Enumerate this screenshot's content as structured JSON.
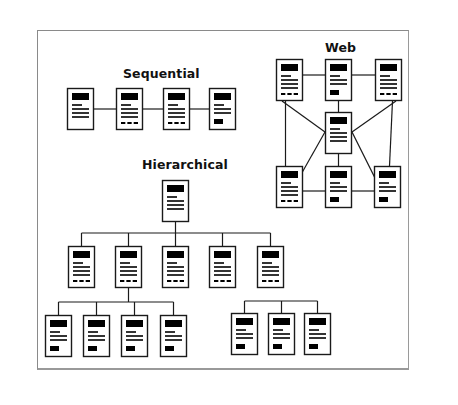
{
  "titles": {
    "sequential": "Sequential",
    "web": "Web",
    "hierarchical": "Hierarchical"
  },
  "colors": {
    "line": "#1a1a1a",
    "page_fill": "#ffffff",
    "block": "#000000",
    "frame": "#8a8a8a"
  },
  "page_icon": {
    "w": 27,
    "h": 42,
    "elements": [
      "header-block",
      "text-lines",
      "footer-dashes-or-button"
    ]
  },
  "diagrams": {
    "sequential": {
      "pages": [
        {
          "x": 67,
          "y": 88,
          "footer": "none"
        },
        {
          "x": 116,
          "y": 88,
          "footer": "dashes"
        },
        {
          "x": 163,
          "y": 88,
          "footer": "dashes"
        },
        {
          "x": 209,
          "y": 88,
          "footer": "button"
        }
      ],
      "links": [
        [
          0,
          1
        ],
        [
          1,
          2
        ],
        [
          2,
          3
        ]
      ]
    },
    "web": {
      "pages": [
        {
          "x": 276,
          "y": 59,
          "footer": "dashes"
        },
        {
          "x": 325,
          "y": 59,
          "footer": "button"
        },
        {
          "x": 375,
          "y": 59,
          "footer": "dashes"
        },
        {
          "x": 325,
          "y": 112,
          "footer": "none"
        },
        {
          "x": 276,
          "y": 166,
          "footer": "dashes"
        },
        {
          "x": 325,
          "y": 166,
          "footer": "button"
        },
        {
          "x": 374,
          "y": 166,
          "footer": "button"
        }
      ]
    },
    "hierarchical": {
      "root": {
        "x": 162,
        "y": 180,
        "footer": "none"
      },
      "level1": [
        {
          "x": 68,
          "y": 246,
          "footer": "dashes"
        },
        {
          "x": 115,
          "y": 246,
          "footer": "dashes"
        },
        {
          "x": 162,
          "y": 246,
          "footer": "dashes"
        },
        {
          "x": 209,
          "y": 246,
          "footer": "dashes"
        },
        {
          "x": 257,
          "y": 246,
          "footer": "dashes"
        }
      ],
      "level2_left": [
        {
          "x": 45,
          "y": 315,
          "footer": "button"
        },
        {
          "x": 83,
          "y": 315,
          "footer": "button"
        },
        {
          "x": 121,
          "y": 315,
          "footer": "button"
        },
        {
          "x": 160,
          "y": 315,
          "footer": "button"
        }
      ],
      "level2_right": [
        {
          "x": 231,
          "y": 313,
          "footer": "button"
        },
        {
          "x": 268,
          "y": 313,
          "footer": "button"
        },
        {
          "x": 304,
          "y": 313,
          "footer": "button"
        }
      ]
    }
  }
}
